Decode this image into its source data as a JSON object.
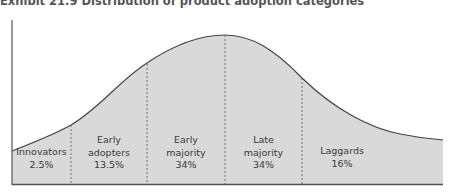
{
  "title": "Exhibit 21.9  Distribution of product adoption categories",
  "colors": {
    "fill": "#d9d9d9",
    "line": "#444444",
    "axis": "#555555"
  },
  "categories": [
    {
      "line1": "",
      "line2": "Innovators",
      "line3": "2.5%"
    },
    {
      "line1": "Early",
      "line2": "adopters",
      "line3": "13.5%"
    },
    {
      "line1": "Early",
      "line2": "majority",
      "line3": "34%"
    },
    {
      "line1": "Late",
      "line2": "majority",
      "line3": "34%"
    },
    {
      "line1": "",
      "line2": "Laggards",
      "line3": "16%"
    }
  ]
}
